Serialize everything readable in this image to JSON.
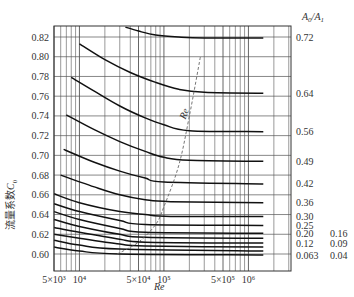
{
  "chart_data": {
    "type": "line",
    "title": "",
    "xlabel": "Re",
    "ylabel": "流量系数C0",
    "ylabel_text": "流量系数",
    "ylabel_symbol": "C",
    "ylabel_sub": "0",
    "x_scale": "log",
    "xlim": [
      5000,
      1500000
    ],
    "ylim": [
      0.595,
      0.83
    ],
    "grid": true,
    "x_tick_labels": [
      "5×10³",
      "10⁴",
      "5×10⁴",
      "10⁵",
      "5×10⁵",
      "10⁶"
    ],
    "x_ticks": [
      5000,
      10000,
      50000,
      100000,
      500000,
      1000000
    ],
    "y_ticks": [
      0.6,
      0.62,
      0.64,
      0.66,
      0.68,
      0.7,
      0.72,
      0.74,
      0.76,
      0.78,
      0.8,
      0.82
    ],
    "y_tick_labels": [
      "0.60",
      "0.62",
      "0.64",
      "0.66",
      "0.68",
      "0.70",
      "0.72",
      "0.74",
      "0.76",
      "0.78",
      "0.80",
      "0.82"
    ],
    "legend_title": "A0/A1",
    "legend_title_parts": {
      "a": "A",
      "a_sub": "0",
      "sep": "/",
      "b": "A",
      "b_sub": "1"
    },
    "dashed_curve_label": "Re",
    "right_labels": [
      {
        "text": "0.72",
        "y": 0.819
      },
      {
        "text": "0.64",
        "y": 0.763
      },
      {
        "text": "0.56",
        "y": 0.724
      },
      {
        "text": "0.49",
        "y": 0.694
      },
      {
        "text": "0.42",
        "y": 0.671
      },
      {
        "text": "0.36",
        "y": 0.652
      },
      {
        "text": "0.30",
        "y": 0.638
      },
      {
        "text": "0.25",
        "y": 0.629
      },
      {
        "text": "0.20",
        "y": 0.621
      },
      {
        "text": "0.12",
        "y": 0.611
      },
      {
        "text": "0.063",
        "y": 0.598
      }
    ],
    "right_labels_col2": [
      {
        "text": "0.16",
        "y": 0.621
      },
      {
        "text": "0.09",
        "y": 0.611
      },
      {
        "text": "0.04",
        "y": 0.598
      }
    ],
    "series": [
      {
        "name": "0.72",
        "x": [
          35000,
          50000,
          80000,
          150000,
          300000,
          1500000
        ],
        "y": [
          0.83,
          0.826,
          0.822,
          0.82,
          0.819,
          0.819
        ]
      },
      {
        "name": "0.64",
        "x": [
          10000,
          20000,
          40000,
          80000,
          150000,
          300000,
          1500000
        ],
        "y": [
          0.813,
          0.797,
          0.784,
          0.774,
          0.767,
          0.764,
          0.763
        ]
      },
      {
        "name": "0.56",
        "x": [
          8000,
          15000,
          30000,
          60000,
          100000,
          200000,
          1500000
        ],
        "y": [
          0.779,
          0.765,
          0.75,
          0.738,
          0.731,
          0.725,
          0.724
        ]
      },
      {
        "name": "0.49",
        "x": [
          7000,
          15000,
          30000,
          60000,
          100000,
          200000,
          1500000
        ],
        "y": [
          0.741,
          0.726,
          0.714,
          0.704,
          0.698,
          0.695,
          0.694
        ]
      },
      {
        "name": "0.42",
        "x": [
          6500,
          15000,
          30000,
          60000,
          100000,
          1500000
        ],
        "y": [
          0.706,
          0.693,
          0.684,
          0.677,
          0.673,
          0.671
        ]
      },
      {
        "name": "0.36",
        "x": [
          6000,
          15000,
          30000,
          60000,
          120000,
          1500000
        ],
        "y": [
          0.68,
          0.668,
          0.66,
          0.655,
          0.653,
          0.652
        ]
      },
      {
        "name": "0.30",
        "x": [
          5000,
          10000,
          30000,
          60000,
          120000,
          1500000
        ],
        "y": [
          0.661,
          0.652,
          0.643,
          0.64,
          0.638,
          0.638
        ]
      },
      {
        "name": "0.25",
        "x": [
          5000,
          10000,
          30000,
          60000,
          1500000
        ],
        "y": [
          0.651,
          0.643,
          0.634,
          0.63,
          0.629
        ]
      },
      {
        "name": "0.20",
        "x": [
          5000,
          10000,
          30000,
          60000,
          1500000
        ],
        "y": [
          0.643,
          0.635,
          0.626,
          0.622,
          0.621
        ]
      },
      {
        "name": "0.16",
        "x": [
          5000,
          10000,
          30000,
          60000,
          1500000
        ],
        "y": [
          0.635,
          0.628,
          0.62,
          0.617,
          0.616
        ]
      },
      {
        "name": "0.12",
        "x": [
          5000,
          10000,
          30000,
          60000,
          1500000
        ],
        "y": [
          0.627,
          0.622,
          0.615,
          0.612,
          0.611
        ]
      },
      {
        "name": "0.09",
        "x": [
          5000,
          10000,
          30000,
          60000,
          1500000
        ],
        "y": [
          0.62,
          0.616,
          0.61,
          0.608,
          0.607
        ]
      },
      {
        "name": "0.063",
        "x": [
          5000,
          10000,
          30000,
          1500000
        ],
        "y": [
          0.614,
          0.609,
          0.605,
          0.603
        ]
      },
      {
        "name": "0.04",
        "x": [
          5000,
          10000,
          30000,
          1500000
        ],
        "y": [
          0.607,
          0.603,
          0.6,
          0.599
        ]
      },
      {
        "name": "Re_critical (dashed)",
        "x": [
          28000,
          50000,
          80000,
          100000,
          150000,
          200000,
          270000
        ],
        "y": [
          0.6,
          0.612,
          0.63,
          0.648,
          0.69,
          0.74,
          0.8
        ]
      }
    ]
  }
}
